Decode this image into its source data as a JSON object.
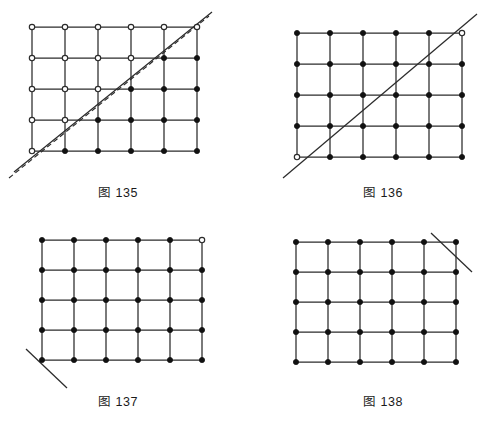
{
  "page": {
    "background_color": "#ffffff",
    "line_color": "#2b2b2b",
    "node_filled_color": "#111111",
    "node_open_color": "#ffffff",
    "width": 493,
    "height": 431
  },
  "figures": [
    {
      "id": "fig-135",
      "caption": "图 135",
      "caption_number": "135",
      "origin": {
        "x": 32,
        "y": 27
      },
      "cell_size": {
        "w": 33,
        "h": 31
      },
      "columns": 6,
      "rows": 5,
      "node_states": [
        [
          "open",
          "open",
          "open",
          "open",
          "open",
          "open"
        ],
        [
          "open",
          "open",
          "open",
          "open",
          "filled",
          "filled"
        ],
        [
          "open",
          "open",
          "open",
          "filled",
          "filled",
          "filled"
        ],
        [
          "open",
          "open",
          "filled",
          "filled",
          "filled",
          "filled"
        ],
        [
          "open",
          "filled",
          "filled",
          "filled",
          "filled",
          "filled"
        ]
      ],
      "cut_lines": [
        {
          "name": "solid-diagonal",
          "style": "solid",
          "x1": 14,
          "y1": 172,
          "x2": 212,
          "y2": 12
        },
        {
          "name": "dashed-diagonal",
          "style": "dashed",
          "x1": 9,
          "y1": 178,
          "x2": 209,
          "y2": 16
        }
      ]
    },
    {
      "id": "fig-136",
      "caption": "图 136",
      "caption_number": "136",
      "origin": {
        "x": 297,
        "y": 33
      },
      "cell_size": {
        "w": 33,
        "h": 31
      },
      "columns": 6,
      "rows": 5,
      "node_states": [
        [
          "filled",
          "filled",
          "filled",
          "filled",
          "filled",
          "open"
        ],
        [
          "filled",
          "filled",
          "filled",
          "filled",
          "filled",
          "filled"
        ],
        [
          "filled",
          "filled",
          "filled",
          "filled",
          "filled",
          "filled"
        ],
        [
          "filled",
          "filled",
          "filled",
          "filled",
          "filled",
          "filled"
        ],
        [
          "open",
          "filled",
          "filled",
          "filled",
          "filled",
          "filled"
        ]
      ],
      "cut_lines": [
        {
          "name": "solid-diagonal",
          "style": "solid",
          "x1": 283,
          "y1": 178,
          "x2": 477,
          "y2": 14
        }
      ]
    },
    {
      "id": "fig-137",
      "caption": "图 137",
      "caption_number": "137",
      "origin": {
        "x": 42,
        "y": 240
      },
      "cell_size": {
        "w": 32,
        "h": 30
      },
      "columns": 6,
      "rows": 5,
      "node_states": [
        [
          "filled",
          "filled",
          "filled",
          "filled",
          "filled",
          "open"
        ],
        [
          "filled",
          "filled",
          "filled",
          "filled",
          "filled",
          "filled"
        ],
        [
          "filled",
          "filled",
          "filled",
          "filled",
          "filled",
          "filled"
        ],
        [
          "filled",
          "filled",
          "filled",
          "filled",
          "filled",
          "filled"
        ],
        [
          "filled",
          "filled",
          "filled",
          "filled",
          "filled",
          "filled"
        ]
      ],
      "cut_lines": [
        {
          "name": "corner-cut-bottom-left",
          "style": "solid",
          "x1": 26,
          "y1": 349,
          "x2": 67,
          "y2": 388
        }
      ]
    },
    {
      "id": "fig-138",
      "caption": "图 138",
      "caption_number": "138",
      "origin": {
        "x": 296,
        "y": 242
      },
      "cell_size": {
        "w": 32,
        "h": 30
      },
      "columns": 6,
      "rows": 5,
      "node_states": [
        [
          "filled",
          "filled",
          "filled",
          "filled",
          "filled",
          "filled"
        ],
        [
          "filled",
          "filled",
          "filled",
          "filled",
          "filled",
          "filled"
        ],
        [
          "filled",
          "filled",
          "filled",
          "filled",
          "filled",
          "filled"
        ],
        [
          "filled",
          "filled",
          "filled",
          "filled",
          "filled",
          "filled"
        ],
        [
          "filled",
          "filled",
          "filled",
          "filled",
          "filled",
          "filled"
        ]
      ],
      "cut_lines": [
        {
          "name": "corner-cut-top-right",
          "style": "solid",
          "x1": 431,
          "y1": 233,
          "x2": 472,
          "y2": 272
        }
      ]
    }
  ],
  "captions": [
    {
      "text": "图 135",
      "x": 118,
      "y": 190
    },
    {
      "text": "图 136",
      "x": 383,
      "y": 190
    },
    {
      "text": "图 137",
      "x": 118,
      "y": 399
    },
    {
      "text": "图 138",
      "x": 383,
      "y": 399
    }
  ]
}
